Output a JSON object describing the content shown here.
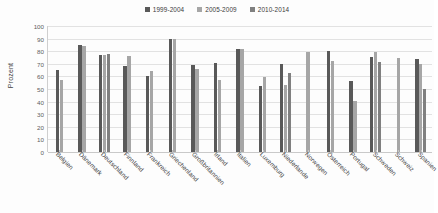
{
  "chart_data": {
    "type": "bar",
    "title": "",
    "xlabel": "",
    "ylabel": "Prozent",
    "ylim": [
      0,
      100
    ],
    "ytick_step": 10,
    "yticks": [
      100,
      90,
      80,
      70,
      60,
      50,
      40,
      30,
      20,
      10,
      0
    ],
    "grid": true,
    "legend_position": "top-center",
    "categories": [
      "Belgien",
      "Dänemark",
      "Deutschland",
      "Finnland",
      "Frankreich",
      "Griechenland",
      "Großbritannien",
      "Irland",
      "Italien",
      "Luxemburg",
      "Niederlande",
      "Norwegen",
      "Österreich",
      "Portugal",
      "Schweden",
      "Schweiz",
      "Spanien"
    ],
    "series": [
      {
        "name": "1999-2004",
        "color": "#595959",
        "values": [
          65,
          85,
          77,
          68,
          60.5,
          89.5,
          69,
          70.5,
          82,
          52,
          70,
          null,
          80,
          56,
          75.5,
          null,
          74
        ]
      },
      {
        "name": "2005-2009",
        "color": "#a6a6a6",
        "values": [
          57,
          84,
          77,
          76,
          64.5,
          89.5,
          65.5,
          57,
          82,
          59.5,
          53,
          79,
          72,
          40.5,
          79,
          75,
          69.5
        ]
      },
      {
        "name": "2010-2014",
        "color": "#808080",
        "values": [
          null,
          null,
          77.5,
          null,
          null,
          null,
          null,
          null,
          null,
          null,
          63,
          null,
          null,
          null,
          71.5,
          null,
          50
        ]
      }
    ]
  },
  "legend": {
    "items": [
      {
        "label": "1999-2004",
        "color": "#595959"
      },
      {
        "label": "2005-2009",
        "color": "#a6a6a6"
      },
      {
        "label": "2010-2014",
        "color": "#808080"
      }
    ]
  },
  "axes": {
    "y_title": "Prozent"
  }
}
